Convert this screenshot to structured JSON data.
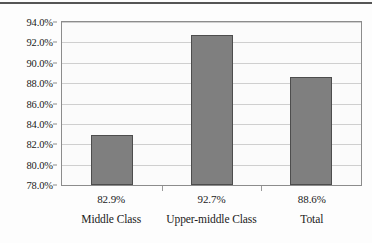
{
  "chart_data": {
    "type": "bar",
    "title": "",
    "subtitle": "",
    "xlabel": "",
    "ylabel": "",
    "categories": [
      "Middle Class",
      "Upper-middle Class",
      "Total"
    ],
    "values": [
      82.9,
      92.7,
      88.6
    ],
    "value_labels": [
      "82.9%",
      "92.7%",
      "88.6%"
    ],
    "ylim": [
      78.0,
      94.0
    ],
    "ytick_values": [
      78.0,
      80.0,
      82.0,
      84.0,
      86.0,
      88.0,
      90.0,
      92.0,
      94.0
    ],
    "ytick_labels": [
      "78.0%",
      "80.0%",
      "82.0%",
      "84.0%",
      "86.0%",
      "88.0%",
      "90.0%",
      "92.0%",
      "94.0%"
    ],
    "grid": true,
    "legend": false,
    "legend_position": "none",
    "series": [
      {
        "name": "",
        "values": [
          82.9,
          92.7,
          88.6
        ],
        "color": "#7f7f7f",
        "border_color": "#4d4d4d"
      }
    ],
    "annotations": []
  },
  "style": {
    "bar_fill": "#7f7f7f",
    "bar_border": "#4d4d4d",
    "grid_color": "#cfcfcf",
    "frame_color": "#8c8c8c",
    "plot_background": "#fbfbfb",
    "page_background": "#fdfdfd",
    "top_rule_color": "#555555",
    "text_color": "#1a1a1a"
  }
}
